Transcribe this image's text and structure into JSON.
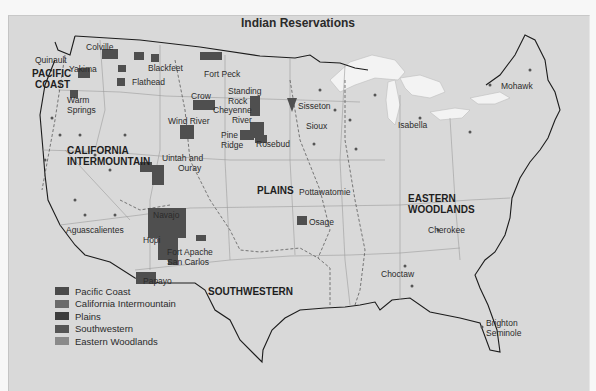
{
  "title": "Indian Reservations",
  "regions": [
    {
      "id": "pacific-coast",
      "label_lines": [
        "PACIFIC",
        "COAST"
      ]
    },
    {
      "id": "california-intermountain",
      "label_lines": [
        "CALIFORNIA",
        "INTERMOUNTAIN"
      ]
    },
    {
      "id": "plains",
      "label_lines": [
        "PLAINS"
      ]
    },
    {
      "id": "southwestern",
      "label_lines": [
        "SOUTHWESTERN"
      ]
    },
    {
      "id": "eastern-woodlands",
      "label_lines": [
        "EASTERN",
        "WOODLANDS"
      ]
    }
  ],
  "reservations": {
    "quinault": "Quinault",
    "colville": "Colville",
    "yakima": "Yakima",
    "blackfeet": "Blackfeet",
    "flathead": "Flathead",
    "fort_peck": "Fort Peck",
    "warm_springs_1": "Warm",
    "warm_springs_2": "Springs",
    "crow": "Crow",
    "standing_rock_1": "Standing",
    "standing_rock_2": "Rock",
    "cheyenne_river_1": "Cheyenne",
    "cheyenne_river_2": "River",
    "sisseton": "Sisseton",
    "wind_river": "Wind River",
    "sioux": "Sioux",
    "pine_ridge_1": "Pine",
    "pine_ridge_2": "Ridge",
    "rosebud": "Rosebud",
    "uintah_1": "Uintah and",
    "uintah_2": "Ouray",
    "pottawatomie": "Pottawatomie",
    "navajo": "Navajo",
    "hopi": "Hopi",
    "fort_apache": "Fort Apache",
    "san_carlos": "San Carlos",
    "aguascalientes": "Aguascalientes",
    "papayo": "Papayo",
    "osage": "Osage",
    "mohawk": "Mohawk",
    "isabella": "Isabella",
    "cherokee": "Cherokee",
    "choctaw": "Choctaw",
    "brighton_1": "Brighton",
    "brighton_2": "Seminole"
  },
  "legend": [
    {
      "label": "Pacific Coast",
      "color": "#4a4a4a"
    },
    {
      "label": "California Intermountain",
      "color": "#6b6b6b"
    },
    {
      "label": "Plains",
      "color": "#3d3d3d"
    },
    {
      "label": "Southwestern",
      "color": "#555555"
    },
    {
      "label": "Eastern Woodlands",
      "color": "#8a8a8a"
    }
  ],
  "colors": {
    "background": "#d9d9d9",
    "lakes": "#f2f2f2",
    "reservation": "#4f4f4f",
    "coastline": "#1a1a1a",
    "state_lines": "#9a9a9a"
  }
}
